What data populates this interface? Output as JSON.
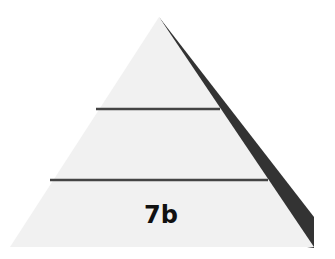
{
  "diagram": {
    "type": "pyramid",
    "levels": [
      {
        "label": ""
      },
      {
        "label": ""
      },
      {
        "label": "7b"
      }
    ],
    "colors": {
      "background": "#ffffff",
      "fill": "#f1f1f1",
      "shadow": "#333333",
      "divider": "#444444",
      "text": "#111111"
    }
  }
}
